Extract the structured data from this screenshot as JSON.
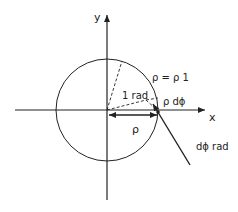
{
  "diagram": {
    "type": "polar-coordinate-differential",
    "axes": {
      "x_label": "x",
      "y_label": "y"
    },
    "labels": {
      "circle_equation": "ρ = ρ 1",
      "one_radian": "1 rad",
      "arc_length": "ρ dϕ",
      "radius": "ρ",
      "differential_angle": "dϕ rad"
    },
    "colors": {
      "stroke": "#222222",
      "background": "#ffffff"
    }
  }
}
